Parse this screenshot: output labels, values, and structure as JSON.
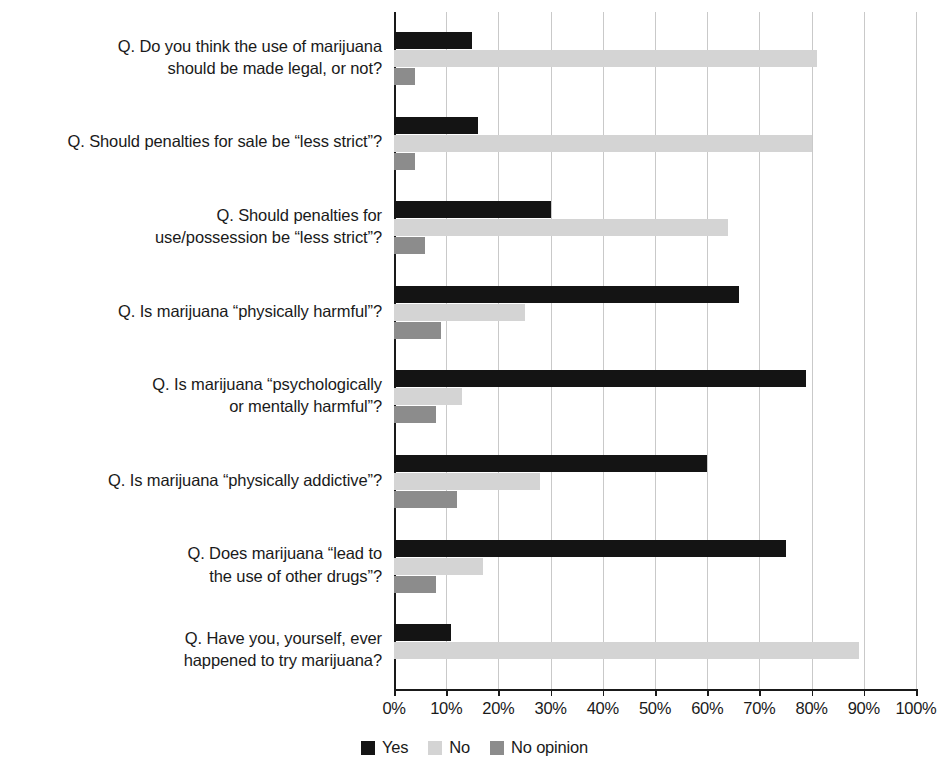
{
  "chart_data": {
    "type": "bar",
    "orientation": "horizontal",
    "title": "",
    "xlabel": "",
    "ylabel": "",
    "xlim": [
      0,
      100
    ],
    "xticks": [
      "0%",
      "10%",
      "20%",
      "30%",
      "40%",
      "50%",
      "60%",
      "70%",
      "80%",
      "90%",
      "100%"
    ],
    "grid": "vertical",
    "legend_position": "bottom-center",
    "categories": [
      "Q. Do you think the use of marijuana should be made legal, or not?",
      "Q. Should penalties for sale be “less strict”?",
      "Q. Should penalties for use/possession be “less strict”?",
      "Q. Is marijuana “physically harmful”?",
      "Q. Is marijuana “psychologically or mentally harmful”?",
      "Q. Is marijuana “physically addictive”?",
      "Q. Does marijuana “lead to the use of other drugs”?",
      "Q. Have you, yourself, ever happened to try marijuana?"
    ],
    "category_lines": [
      [
        "Q. Do you think the use of marijuana",
        "should be made legal, or not?"
      ],
      [
        "Q. Should penalties for sale be “less strict”?"
      ],
      [
        "Q. Should penalties for",
        "use/possession be “less strict”?"
      ],
      [
        "Q. Is marijuana “physically harmful”?"
      ],
      [
        "Q. Is marijuana “psychologically",
        "or mentally harmful”?"
      ],
      [
        "Q. Is marijuana “physically addictive”?"
      ],
      [
        "Q. Does marijuana “lead to",
        "the use of other drugs”?"
      ],
      [
        "Q. Have you, yourself, ever",
        "happened to try marijuana?"
      ]
    ],
    "series": [
      {
        "name": "Yes",
        "color": "#141414",
        "values": [
          15,
          16,
          30,
          66,
          79,
          60,
          75,
          11
        ]
      },
      {
        "name": "No",
        "color": "#d4d4d4",
        "values": [
          81,
          80,
          64,
          25,
          13,
          28,
          17,
          89
        ]
      },
      {
        "name": "No opinion",
        "color": "#8c8c8c",
        "values": [
          4,
          4,
          6,
          9,
          8,
          12,
          8,
          0
        ]
      }
    ]
  },
  "legend": {
    "items": [
      {
        "label": "Yes",
        "color": "#141414"
      },
      {
        "label": "No",
        "color": "#d4d4d4"
      },
      {
        "label": "No opinion",
        "color": "#8c8c8c"
      }
    ]
  },
  "axis": {
    "tick_labels": [
      "0%",
      "10%",
      "20%",
      "30%",
      "40%",
      "50%",
      "60%",
      "70%",
      "80%",
      "90%",
      "100%"
    ]
  },
  "colors": {
    "yes": "#141414",
    "no": "#d4d4d4",
    "no_opinion": "#8c8c8c",
    "gridline": "#c9c9c9",
    "axis": "#1a1a1a",
    "background": "#ffffff"
  }
}
